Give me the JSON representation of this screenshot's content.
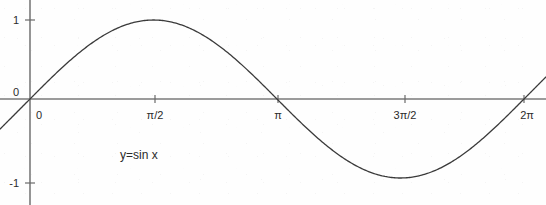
{
  "figure": {
    "width": 546,
    "height": 205,
    "background_color": "#fefefe"
  },
  "colors": {
    "curve": "#3a3a3a",
    "axis": "#7a7a7a",
    "text": "#2b2b2b"
  },
  "annotation": {
    "equation_label": "y=sin x"
  },
  "chart_data": {
    "type": "line",
    "title": "",
    "subtitle": "",
    "xlabel": "",
    "ylabel": "",
    "function": "y=sin x",
    "grid": false,
    "legend": false,
    "legend_position": "none",
    "xlim": [
      -0.25,
      2.42
    ],
    "ylim": [
      -1.28,
      1.28
    ],
    "xlim_units": "pi",
    "x_tick_labels": [
      "0",
      "π/2",
      "π",
      "3π/2",
      "2π"
    ],
    "x_tick_values": [
      0,
      1.5707963,
      3.1415927,
      4.712389,
      6.2831853
    ],
    "y_tick_labels": [
      "1",
      "0",
      "-1"
    ],
    "y_tick_values": [
      1,
      0,
      -1
    ],
    "series": [
      {
        "name": "y=sin x",
        "x": [
          0,
          0.3926991,
          0.7853982,
          1.1780972,
          1.5707963,
          1.9634954,
          2.3561945,
          2.7488936,
          3.1415927,
          3.5342917,
          3.9269908,
          4.3196899,
          4.712389,
          5.1050881,
          5.4977871,
          5.8904862,
          6.2831853
        ],
        "y": [
          0,
          0.3827,
          0.7071,
          0.9239,
          1.0,
          0.9239,
          0.7071,
          0.3827,
          0,
          -0.3827,
          -0.7071,
          -0.9239,
          -1.0,
          -0.9239,
          -0.7071,
          -0.3827,
          0
        ],
        "x_labels": [
          "0",
          "π/8",
          "π/4",
          "3π/8",
          "π/2",
          "5π/8",
          "3π/4",
          "7π/8",
          "π",
          "9π/8",
          "5π/4",
          "11π/8",
          "3π/2",
          "13π/8",
          "7π/4",
          "15π/8",
          "2π"
        ]
      }
    ],
    "key_points": [
      {
        "label": "zero",
        "x": 0,
        "y": 0
      },
      {
        "label": "maximum",
        "x": 1.5707963,
        "y": 1
      },
      {
        "label": "zero",
        "x": 3.1415927,
        "y": 0
      },
      {
        "label": "minimum",
        "x": 4.712389,
        "y": -1
      },
      {
        "label": "zero",
        "x": 6.2831853,
        "y": 0
      }
    ],
    "period": 6.2831853,
    "amplitude": 1
  }
}
